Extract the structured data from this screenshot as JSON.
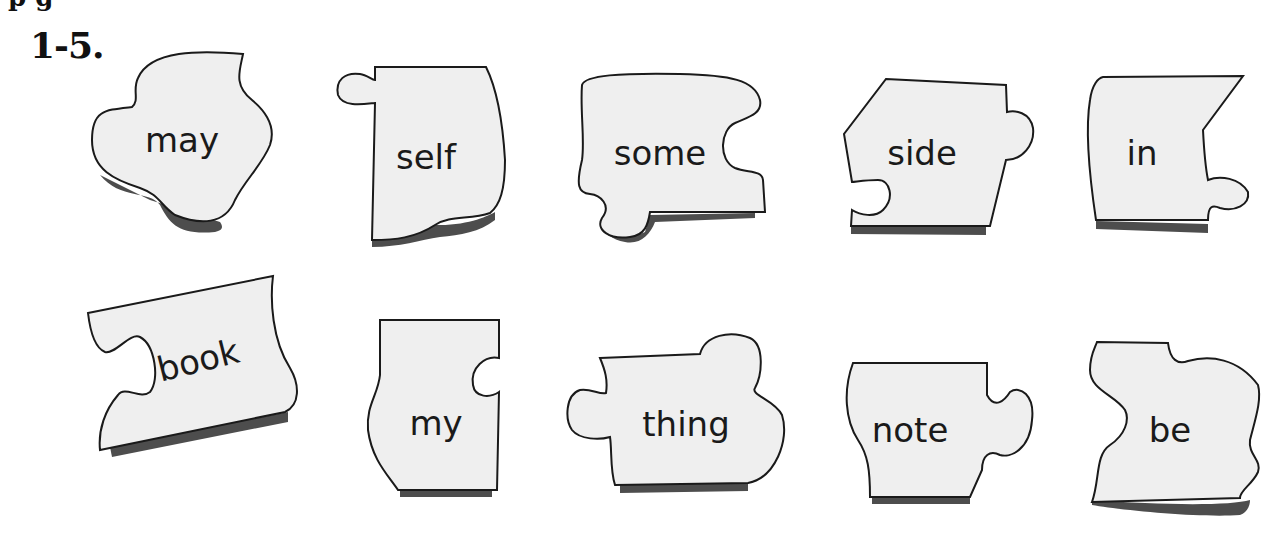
{
  "heading_partial": "p        g",
  "section_number": "1-5.",
  "colors": {
    "piece_fill": "#efefef",
    "piece_stroke": "#1a1a1a",
    "shadow": "#4d4d4d",
    "text": "#1a1a1a"
  },
  "pieces": {
    "row1": [
      {
        "word": "may"
      },
      {
        "word": "self"
      },
      {
        "word": "some"
      },
      {
        "word": "side"
      },
      {
        "word": "in"
      }
    ],
    "row2": [
      {
        "word": "book"
      },
      {
        "word": "my"
      },
      {
        "word": "thing"
      },
      {
        "word": "note"
      },
      {
        "word": "be"
      }
    ]
  }
}
